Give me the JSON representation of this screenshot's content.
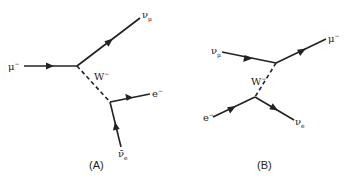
{
  "diagrams": [
    {
      "caption": "(A)",
      "labels": {
        "incoming": "μ",
        "incoming_sup": "−",
        "out1": "ν",
        "out1_sub": "μ",
        "boson": "W",
        "boson_sup": "−",
        "out2": "e",
        "out2_sup": "−",
        "in2": "ν̄",
        "in2_sub": "e"
      }
    },
    {
      "caption": "(B)",
      "labels": {
        "in1": "ν",
        "in1_sub": "μ",
        "out1": "μ",
        "out1_sup": "−",
        "boson": "W",
        "boson_sup": "−",
        "in2": "e",
        "in2_sup": "−",
        "out2": "ν",
        "out2_sub": "e"
      }
    }
  ]
}
